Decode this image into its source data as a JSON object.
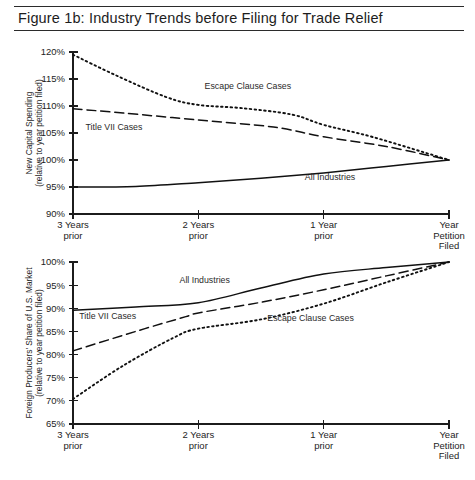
{
  "figure": {
    "title": "Figure 1b:  Industry Trends before Filing for Trade Relief"
  },
  "axis": {
    "x_categories": [
      {
        "line1": "3 Years",
        "line2": "prior"
      },
      {
        "line1": "2 Years",
        "line2": "prior"
      },
      {
        "line1": "1 Year",
        "line2": "prior"
      },
      {
        "line1": "Year",
        "line2": "Petition",
        "line3": "Filed"
      }
    ]
  },
  "series_names": {
    "escape": "Escape Clause Cases",
    "title7": "Title VII Cases",
    "all": "All Industries"
  },
  "chart_data": [
    {
      "type": "line",
      "id": "new-capital-spending",
      "title": "New Capital Spending (relative to year petition filed)",
      "ylabel_line1": "New Capital Spending",
      "ylabel_line2": "(relative to year petition filed)",
      "xlabel": "",
      "x": [
        "3 Years prior",
        "2 Years prior",
        "1 Year prior",
        "Year Petition Filed"
      ],
      "yticks": [
        90,
        95,
        100,
        105,
        110,
        115,
        120
      ],
      "ytick_labels": [
        "90%",
        "95%",
        "100%",
        "105%",
        "110%",
        "115%",
        "120%"
      ],
      "ylim": [
        90,
        120
      ],
      "grid": false,
      "legend": "inline-annotations",
      "series": [
        {
          "name": "Escape Clause Cases",
          "style": "dotted",
          "values": [
            119.5,
            110.2,
            106.5,
            100.0
          ],
          "points": [
            {
              "x": 0.0,
              "y": 119.5
            },
            {
              "x": 0.35,
              "y": 115.6
            },
            {
              "x": 0.75,
              "y": 111.6
            },
            {
              "x": 1.0,
              "y": 110.2
            },
            {
              "x": 1.35,
              "y": 109.6
            },
            {
              "x": 1.75,
              "y": 108.4
            },
            {
              "x": 2.0,
              "y": 106.5
            },
            {
              "x": 2.4,
              "y": 104.2
            },
            {
              "x": 3.0,
              "y": 100.0
            }
          ]
        },
        {
          "name": "Title VII Cases",
          "style": "dashed",
          "values": [
            109.5,
            107.4,
            104.3,
            100.0
          ],
          "points": [
            {
              "x": 0.0,
              "y": 109.5
            },
            {
              "x": 0.4,
              "y": 108.7
            },
            {
              "x": 1.0,
              "y": 107.4
            },
            {
              "x": 1.6,
              "y": 106.1
            },
            {
              "x": 2.0,
              "y": 104.3
            },
            {
              "x": 2.5,
              "y": 102.5
            },
            {
              "x": 3.0,
              "y": 100.0
            }
          ]
        },
        {
          "name": "All Industries",
          "style": "solid",
          "values": [
            95.0,
            95.8,
            97.6,
            100.0
          ],
          "points": [
            {
              "x": 0.0,
              "y": 95.0
            },
            {
              "x": 0.5,
              "y": 95.1
            },
            {
              "x": 1.0,
              "y": 95.8
            },
            {
              "x": 1.5,
              "y": 96.6
            },
            {
              "x": 2.0,
              "y": 97.6
            },
            {
              "x": 2.5,
              "y": 98.8
            },
            {
              "x": 3.0,
              "y": 100.0
            }
          ]
        }
      ],
      "annotations": [
        {
          "text": "Escape Clause Cases",
          "x": 1.05,
          "y": 113.2
        },
        {
          "text": "Title VII Cases",
          "x": 0.1,
          "y": 105.6
        },
        {
          "text": "All Industries",
          "x": 1.85,
          "y": 96.3
        }
      ]
    },
    {
      "type": "line",
      "id": "foreign-producers-share",
      "title": "Foreign Producers' Share of U.S. Market (relative to year petition filed)",
      "ylabel_line1": "Foreign Producers' Share of U.S. Market",
      "ylabel_line2": "(relative to year petition filed)",
      "xlabel": "",
      "x": [
        "3 Years prior",
        "2 Years prior",
        "1 Year prior",
        "Year Petition Filed"
      ],
      "yticks": [
        65,
        70,
        75,
        80,
        85,
        90,
        95,
        100
      ],
      "ytick_labels": [
        "65%",
        "70%",
        "75%",
        "80%",
        "85%",
        "90%",
        "95%",
        "100%"
      ],
      "ylim": [
        65,
        100
      ],
      "grid": false,
      "legend": "inline-annotations",
      "series": [
        {
          "name": "All Industries",
          "style": "solid",
          "values": [
            89.6,
            91.2,
            97.4,
            100.0
          ],
          "points": [
            {
              "x": 0.0,
              "y": 89.6
            },
            {
              "x": 0.5,
              "y": 90.3
            },
            {
              "x": 1.0,
              "y": 91.2
            },
            {
              "x": 1.5,
              "y": 94.4
            },
            {
              "x": 2.0,
              "y": 97.4
            },
            {
              "x": 2.5,
              "y": 98.8
            },
            {
              "x": 3.0,
              "y": 100.0
            }
          ]
        },
        {
          "name": "Title VII Cases",
          "style": "dashed",
          "values": [
            80.8,
            89.0,
            94.0,
            100.0
          ],
          "points": [
            {
              "x": 0.0,
              "y": 80.8
            },
            {
              "x": 0.5,
              "y": 85.0
            },
            {
              "x": 0.9,
              "y": 88.2
            },
            {
              "x": 1.0,
              "y": 89.0
            },
            {
              "x": 1.5,
              "y": 91.3
            },
            {
              "x": 2.0,
              "y": 94.0
            },
            {
              "x": 2.5,
              "y": 97.0
            },
            {
              "x": 3.0,
              "y": 100.0
            }
          ]
        },
        {
          "name": "Escape Clause Cases",
          "style": "dotted",
          "values": [
            70.4,
            85.6,
            91.0,
            100.0
          ],
          "points": [
            {
              "x": 0.0,
              "y": 70.4
            },
            {
              "x": 0.4,
              "y": 77.6
            },
            {
              "x": 0.8,
              "y": 83.6
            },
            {
              "x": 1.0,
              "y": 85.6
            },
            {
              "x": 1.5,
              "y": 87.6
            },
            {
              "x": 2.0,
              "y": 91.0
            },
            {
              "x": 2.5,
              "y": 95.6
            },
            {
              "x": 3.0,
              "y": 100.0
            }
          ]
        }
      ],
      "annotations": [
        {
          "text": "All Industries",
          "x": 0.85,
          "y": 95.4
        },
        {
          "text": "Title VII Cases",
          "x": 0.05,
          "y": 87.6
        },
        {
          "text": "Escape Clause Cases",
          "x": 1.55,
          "y": 87.2
        }
      ]
    }
  ]
}
